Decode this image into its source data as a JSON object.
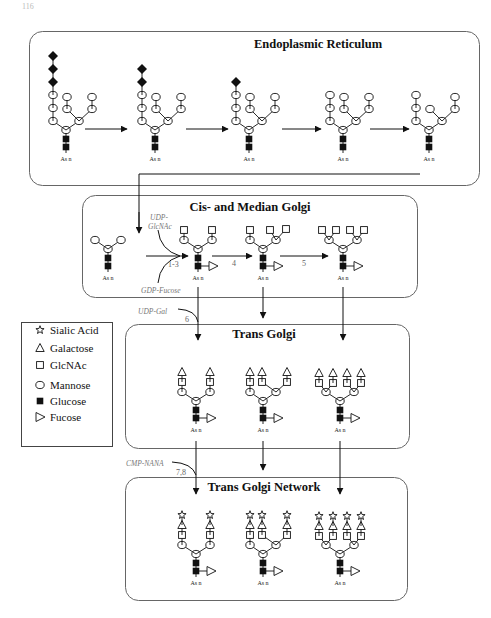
{
  "page_number": "116",
  "compartments": [
    {
      "id": "er",
      "title": "Endoplasmic Reticulum"
    },
    {
      "id": "cis",
      "title": "Cis- and Median Golgi"
    },
    {
      "id": "trans",
      "title": "Trans Golgi"
    },
    {
      "id": "tgn",
      "title": "Trans Golgi Network"
    }
  ],
  "asn_label": "As n",
  "enzyme_labels": {
    "udp_glcnac_line1": "UDP-",
    "udp_glcnac_line2": "GlcNAc",
    "gdp_fucose": "GDP-Fucose",
    "udp_gal": "UDP-Gal",
    "cmp_nana": "CMP-NANA"
  },
  "step_labels": {
    "s1_3": "1-3",
    "s4": "4",
    "s5": "5",
    "s6": "6",
    "s7_8": "7,8"
  },
  "legend": {
    "items": [
      {
        "symbol": "star",
        "label": "Sialic Acid"
      },
      {
        "symbol": "triangle",
        "label": "Galactose"
      },
      {
        "symbol": "square",
        "label": "GlcNAc"
      },
      {
        "symbol": "circle",
        "label": "Mannose"
      },
      {
        "symbol": "filled-square",
        "label": "Glucose"
      },
      {
        "symbol": "right-triangle",
        "label": "Fucose"
      }
    ]
  },
  "colors": {
    "stroke": "#111111",
    "box_border": "#666666",
    "enzyme_text": "#777777"
  }
}
